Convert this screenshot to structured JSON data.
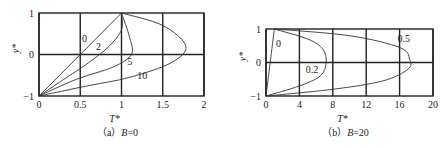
{
  "chart_data": [
    {
      "type": "line",
      "panel": "a",
      "caption_prefix": "（a）",
      "caption_var": "B",
      "caption_value": "=0",
      "xlabel": "T*",
      "ylabel": "y*",
      "xlim": [
        0,
        2
      ],
      "ylim": [
        -1,
        1
      ],
      "xticks": [
        "0",
        "0.5",
        "1",
        "1.5",
        "2"
      ],
      "yticks": [
        "1",
        "0",
        "−1"
      ],
      "grid": true,
      "series": [
        {
          "name": "0",
          "points": [
            [
              0,
              -1
            ],
            [
              0.25,
              -0.5
            ],
            [
              0.5,
              0
            ],
            [
              0.75,
              0.5
            ],
            [
              1,
              1
            ]
          ]
        },
        {
          "name": "2",
          "points": [
            [
              0,
              -1
            ],
            [
              0.3,
              -0.6
            ],
            [
              0.6,
              -0.2
            ],
            [
              0.85,
              0.2
            ],
            [
              1.0,
              0.6
            ],
            [
              1.0,
              1
            ]
          ]
        },
        {
          "name": "5",
          "points": [
            [
              0,
              -1
            ],
            [
              0.45,
              -0.6
            ],
            [
              0.9,
              -0.3
            ],
            [
              1.12,
              0
            ],
            [
              1.1,
              0.4
            ],
            [
              1.0,
              1
            ]
          ]
        },
        {
          "name": "10",
          "points": [
            [
              0,
              -1
            ],
            [
              0.6,
              -0.75
            ],
            [
              1.1,
              -0.55
            ],
            [
              1.6,
              -0.2
            ],
            [
              1.78,
              0.2
            ],
            [
              1.5,
              0.7
            ],
            [
              1.0,
              1
            ]
          ]
        }
      ],
      "curve_labels": [
        {
          "text": "0",
          "x": 0.55,
          "y": 0.3
        },
        {
          "text": "2",
          "x": 0.72,
          "y": 0.1
        },
        {
          "text": "5",
          "x": 1.1,
          "y": -0.25
        },
        {
          "text": "10",
          "x": 1.25,
          "y": -0.6
        }
      ]
    },
    {
      "type": "line",
      "panel": "b",
      "caption_prefix": "（b）",
      "caption_var": "B",
      "caption_value": "=20",
      "xlabel": "T*",
      "ylabel": "y*",
      "xlim": [
        0,
        20
      ],
      "ylim": [
        -1,
        1
      ],
      "xticks": [
        "0",
        "4",
        "8",
        "12",
        "16",
        "20"
      ],
      "yticks": [
        "1",
        "0",
        "−1"
      ],
      "grid": true,
      "series": [
        {
          "name": "0",
          "points": [
            [
              0,
              -1
            ],
            [
              0.5,
              0
            ],
            [
              1,
              1
            ]
          ]
        },
        {
          "name": "0.2",
          "points": [
            [
              0,
              -1
            ],
            [
              4,
              -0.7
            ],
            [
              6.5,
              -0.4
            ],
            [
              7.2,
              0
            ],
            [
              6.8,
              0.4
            ],
            [
              5,
              0.7
            ],
            [
              1,
              1
            ]
          ]
        },
        {
          "name": "0.5",
          "points": [
            [
              0,
              -1
            ],
            [
              8,
              -0.8
            ],
            [
              14,
              -0.55
            ],
            [
              17,
              -0.2
            ],
            [
              17.2,
              0.1
            ],
            [
              16,
              0.45
            ],
            [
              10,
              0.8
            ],
            [
              1,
              1
            ]
          ]
        }
      ],
      "curve_labels": [
        {
          "text": "0",
          "x": 1.5,
          "y": 0.45
        },
        {
          "text": "0.2",
          "x": 5.5,
          "y": -0.3
        },
        {
          "text": "0.5",
          "x": 16.5,
          "y": 0.6
        }
      ]
    }
  ]
}
